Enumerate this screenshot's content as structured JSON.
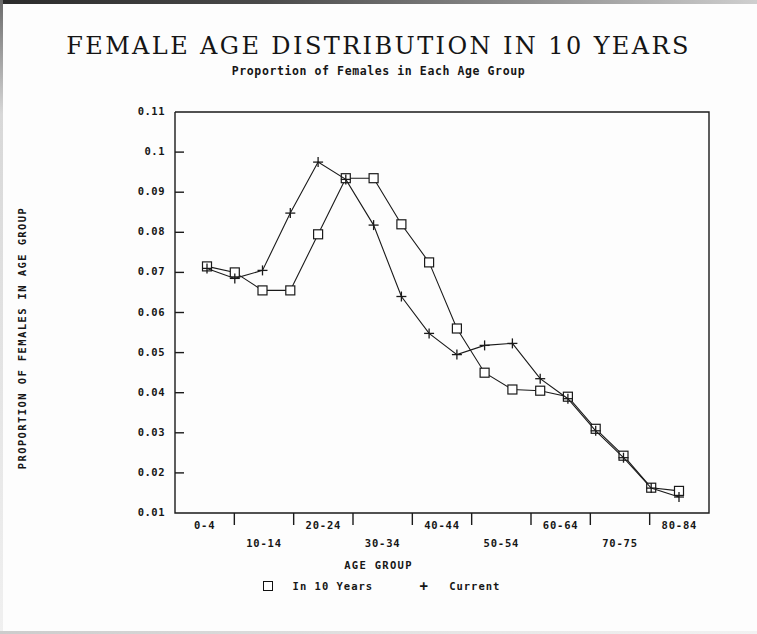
{
  "chart_data": {
    "type": "line",
    "title": "FEMALE AGE DISTRIBUTION IN 10 YEARS",
    "subtitle": "Proportion of Females in Each Age Group",
    "xlabel": "AGE GROUP",
    "ylabel": "PROPORTION OF FEMALES IN AGE GROUP",
    "grid": false,
    "legend_position": "bottom",
    "ylim": [
      0.01,
      0.11
    ],
    "ytick_labels": [
      "0.11",
      "0.1",
      "0.09",
      "0.08",
      "0.07",
      "0.06",
      "0.05",
      "0.04",
      "0.03",
      "0.02",
      "0.01"
    ],
    "ytick_values": [
      0.11,
      0.1,
      0.09,
      0.08,
      0.07,
      0.06,
      0.05,
      0.04,
      0.03,
      0.02,
      0.01
    ],
    "xtick_labels": [
      "0-4",
      "10-14",
      "20-24",
      "30-34",
      "40-44",
      "50-54",
      "60-64",
      "70-75",
      "80-84"
    ],
    "categories": [
      "0-4",
      "5-9",
      "10-14",
      "15-19",
      "20-24",
      "25-29",
      "30-34",
      "35-39",
      "40-44",
      "45-49",
      "50-54",
      "55-59",
      "60-64",
      "65-69",
      "70-75",
      "75-79",
      "80-84",
      "85+"
    ],
    "series": [
      {
        "name": "In 10 Years",
        "marker": "square",
        "values": [
          0.0715,
          0.07,
          0.0655,
          0.0655,
          0.0795,
          0.0935,
          0.0935,
          0.082,
          0.0725,
          0.056,
          0.045,
          0.0408,
          0.0405,
          0.039,
          0.031,
          0.0243,
          0.0163,
          0.0155
        ]
      },
      {
        "name": "Current",
        "marker": "plus",
        "values": [
          0.071,
          0.0685,
          0.0705,
          0.0848,
          0.0975,
          0.0932,
          0.0818,
          0.064,
          0.0548,
          0.0495,
          0.0518,
          0.0523,
          0.0435,
          0.0385,
          0.0305,
          0.0238,
          0.0162,
          0.014
        ]
      }
    ]
  },
  "legend": {
    "items": [
      {
        "symbol": "square",
        "label": "In 10 Years"
      },
      {
        "symbol": "plus",
        "label": "Current"
      }
    ]
  }
}
